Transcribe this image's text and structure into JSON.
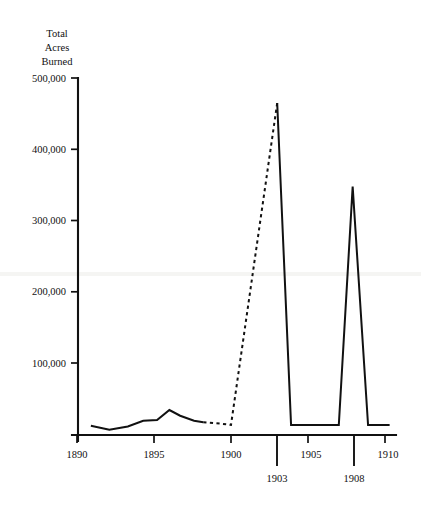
{
  "chart_data": {
    "type": "line",
    "title": "",
    "ylabel": "Total\nAcres\nBurned",
    "ylabel_lines": [
      "Total",
      "Acres",
      "Burned"
    ],
    "xlabel": "",
    "xlim": [
      1890,
      1910.6
    ],
    "ylim": [
      0,
      500000
    ],
    "grid": false,
    "legend": "none",
    "y_ticks": [
      100000,
      200000,
      300000,
      400000,
      500000
    ],
    "y_tick_labels": [
      "100,000",
      "200,000",
      "300,000",
      "400,000",
      "500,000"
    ],
    "x_ticks": [
      1890,
      1895,
      1900,
      1905,
      1910
    ],
    "x_tick_labels": [
      "1890",
      "1895",
      "1900",
      "1905",
      "1910"
    ],
    "x_ticks_emphasized": [
      1903,
      1908
    ],
    "x_tick_labels_emphasized": [
      "1903",
      "1908"
    ],
    "series": [
      {
        "name": "Total acres burned (recorded)",
        "style": "solid",
        "x": [
          1890.9,
          1892.1,
          1893.3,
          1894.3,
          1895.2,
          1896.0,
          1896.7,
          1897.6,
          1898.2
        ],
        "values": [
          13000,
          7500,
          12000,
          20000,
          21000,
          35000,
          27000,
          20000,
          18000
        ]
      },
      {
        "name": "Total acres burned (estimated)",
        "style": "dashed",
        "x": [
          1898.2,
          1899.3,
          1900.0,
          1903.0
        ],
        "values": [
          18000,
          16000,
          14000,
          465000
        ]
      },
      {
        "name": "Total acres burned (1903 peak and after)",
        "style": "solid",
        "x": [
          1903.0,
          1903.9,
          1904.1,
          1906.8,
          1907.0,
          1907.9,
          1908.9,
          1909.1,
          1910.3
        ],
        "values": [
          465000,
          14000,
          14000,
          14000,
          14000,
          348000,
          14000,
          14000,
          14000
        ]
      }
    ],
    "annotations": [
      {
        "label": "1903",
        "note": "peak near 465,000 acres"
      },
      {
        "label": "1908",
        "note": "peak near 348,000 acres"
      }
    ]
  }
}
